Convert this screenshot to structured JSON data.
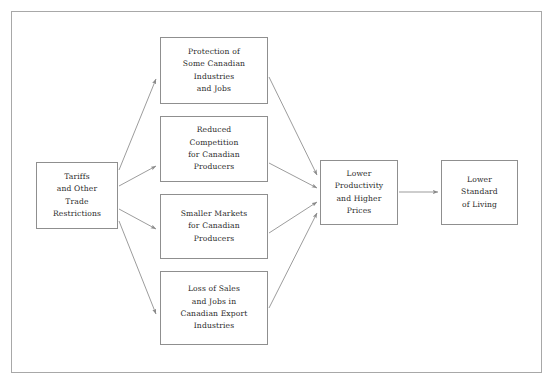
{
  "figure": {
    "type": "flow-diagram",
    "topic": "Economic effects of tariffs and other trade restrictions in Canada",
    "clipped_header_text": "",
    "colors": {
      "page_background": "#ffffff",
      "frame_border": "#a8a8a8",
      "node_border": "#8f8f8f",
      "node_fill": "#ffffff",
      "edge_stroke": "#8a8a8a",
      "text": "#2b2b2b"
    }
  },
  "nodes": {
    "tariffs": {
      "id": "tariffs",
      "label": "Tariffs\nand Other\nTrade\nRestrictions",
      "column": "cause"
    },
    "protection": {
      "id": "protection",
      "label": "Protection of\nSome Canadian\nIndustries\nand Jobs",
      "column": "effect"
    },
    "competition": {
      "id": "competition",
      "label": "Reduced\nCompetition\nfor Canadian\nProducers",
      "column": "effect"
    },
    "markets": {
      "id": "markets",
      "label": "Smaller Markets\nfor Canadian\nProducers",
      "column": "effect"
    },
    "loss": {
      "id": "loss",
      "label": "Loss of Sales\nand Jobs in\nCanadian Export\nIndustries",
      "column": "effect"
    },
    "productivity": {
      "id": "productivity",
      "label": "Lower\nProductivity\nand Higher\nPrices",
      "column": "consequence"
    },
    "standard": {
      "id": "standard",
      "label": "Lower\nStandard\nof Living",
      "column": "outcome"
    }
  },
  "edges": [
    {
      "from": "tariffs",
      "to": "protection",
      "arrow": true
    },
    {
      "from": "tariffs",
      "to": "competition",
      "arrow": true
    },
    {
      "from": "tariffs",
      "to": "markets",
      "arrow": true
    },
    {
      "from": "tariffs",
      "to": "loss",
      "arrow": true
    },
    {
      "from": "protection",
      "to": "productivity",
      "arrow": true
    },
    {
      "from": "competition",
      "to": "productivity",
      "arrow": true
    },
    {
      "from": "markets",
      "to": "productivity",
      "arrow": true
    },
    {
      "from": "loss",
      "to": "productivity",
      "arrow": true
    },
    {
      "from": "productivity",
      "to": "standard",
      "arrow": true
    }
  ]
}
